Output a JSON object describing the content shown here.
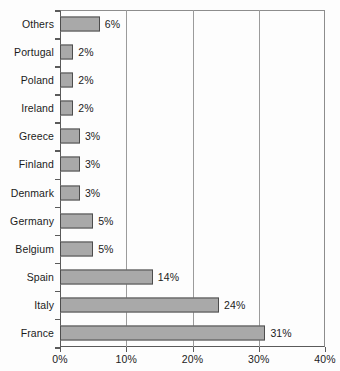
{
  "chart_data": {
    "type": "bar",
    "orientation": "horizontal",
    "title": "",
    "subtitle": "",
    "xlabel": "",
    "ylabel": "",
    "categories": [
      "Others",
      "Portugal",
      "Poland",
      "Ireland",
      "Greece",
      "Finland",
      "Denmark",
      "Germany",
      "Belgium",
      "Spain",
      "Italy",
      "France"
    ],
    "values": [
      6,
      2,
      2,
      2,
      3,
      3,
      3,
      5,
      5,
      14,
      24,
      31
    ],
    "value_labels": [
      "6%",
      "2%",
      "2%",
      "2%",
      "3%",
      "3%",
      "3%",
      "5%",
      "5%",
      "14%",
      "24%",
      "31%"
    ],
    "xlim": [
      0,
      40
    ],
    "xticks": [
      0,
      10,
      20,
      30,
      40
    ],
    "xtick_labels": [
      "0%",
      "10%",
      "20%",
      "30%",
      "40%"
    ],
    "grid": "vertical",
    "legend": "none",
    "bar_fill": "#a9a9a9",
    "bar_border": "#4d4d4d",
    "axis_color": "#5a5a5a",
    "gridline_color": "#9b9b9b",
    "background": "#fdfdfd"
  }
}
